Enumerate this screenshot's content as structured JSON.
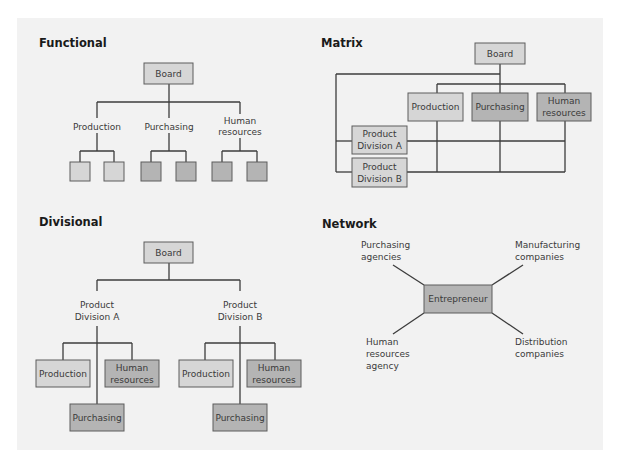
{
  "colors": {
    "panel_bg": "#f2f2f2",
    "box_light": "#d6d6d6",
    "box_dark": "#b4b4b4",
    "line": "#3c3c3c",
    "text": "#3a3a3a",
    "heading": "#1a1a1a"
  },
  "functional": {
    "title": "Functional",
    "board": "Board",
    "departments": [
      {
        "label": "Production",
        "children_shade": "light"
      },
      {
        "label": "Purchasing",
        "children_shade": "dark"
      },
      {
        "label_lines": [
          "Human",
          "resources"
        ],
        "children_shade": "dark"
      }
    ]
  },
  "matrix": {
    "title": "Matrix",
    "board": "Board",
    "functions": [
      {
        "label": "Production",
        "shade": "light"
      },
      {
        "label": "Purchasing",
        "shade": "dark"
      },
      {
        "label_lines": [
          "Human",
          "resources"
        ],
        "shade": "dark"
      }
    ],
    "divisions": [
      {
        "label_lines": [
          "Product",
          "Division A"
        ]
      },
      {
        "label_lines": [
          "Product",
          "Division B"
        ]
      }
    ]
  },
  "divisional": {
    "title": "Divisional",
    "board": "Board",
    "divisions": [
      {
        "label_lines": [
          "Product",
          "Division A"
        ],
        "units": {
          "production": "Production",
          "hr_lines": [
            "Human",
            "resources"
          ],
          "purchasing": "Purchasing"
        }
      },
      {
        "label_lines": [
          "Product",
          "Division B"
        ],
        "units": {
          "production": "Production",
          "hr_lines": [
            "Human",
            "resources"
          ],
          "purchasing": "Purchasing"
        }
      }
    ]
  },
  "network": {
    "title": "Network",
    "center": "Entrepreneur",
    "partners": {
      "top_left": [
        "Purchasing",
        "agencies"
      ],
      "top_right": [
        "Manufacturing",
        "companies"
      ],
      "bottom_left": [
        "Human",
        "resources",
        "agency"
      ],
      "bottom_right": [
        "Distribution",
        "companies"
      ]
    }
  }
}
